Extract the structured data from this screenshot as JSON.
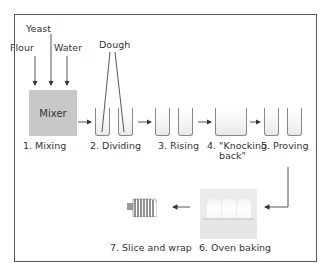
{
  "diagram": {
    "inputs": {
      "yeast": "Yeast",
      "flour": "Flour",
      "water": "Water"
    },
    "mixer_label": "Mixer",
    "dough_label": "Dough",
    "steps": [
      {
        "id": 1,
        "label": "1. Mixing"
      },
      {
        "id": 2,
        "label": "2. Dividing"
      },
      {
        "id": 3,
        "label": "3. Rising"
      },
      {
        "id": 4,
        "label_line1": "4. \"Knocking",
        "label_line2": "back\""
      },
      {
        "id": 5,
        "label": "5. Proving"
      },
      {
        "id": 6,
        "label": "6. Oven baking"
      },
      {
        "id": 7,
        "label": "7. Slice and wrap"
      }
    ],
    "colors": {
      "frame": "#555555",
      "mixer_fill": "#c8c8c8",
      "arrow": "#444444",
      "tank_border": "#888888",
      "oven_fill": "#ebebeb"
    }
  }
}
